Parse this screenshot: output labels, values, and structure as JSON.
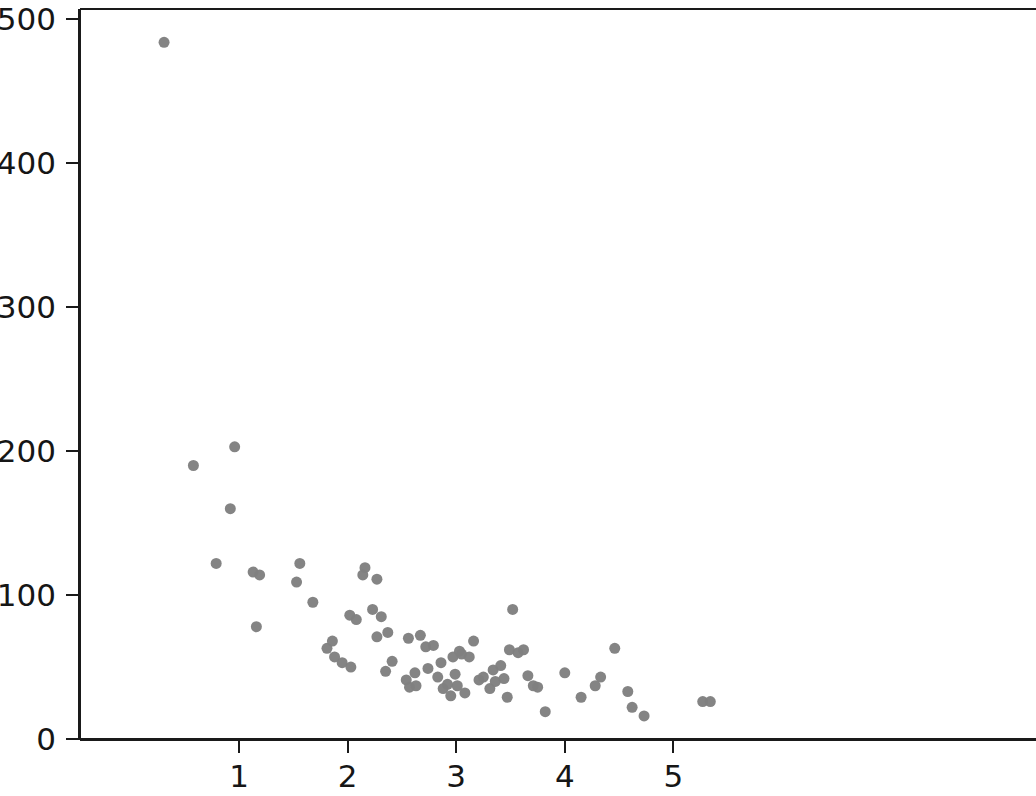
{
  "chart_data": {
    "type": "scatter",
    "title": "",
    "subtitle": "",
    "xlabel": "",
    "ylabel": "",
    "xlim": [
      0.14,
      5.72
    ],
    "ylim": [
      -5.6,
      507
    ],
    "xticks": [
      1,
      2,
      3,
      4,
      5
    ],
    "xtick_labels": [
      "1",
      "2",
      "3",
      "4",
      "5"
    ],
    "yticks": [
      0,
      100,
      200,
      300,
      400,
      500
    ],
    "ytick_labels": [
      "0",
      "100",
      "200",
      "300",
      "400",
      "500"
    ],
    "grid": false,
    "legend": null,
    "marker": {
      "shape": "circle",
      "color": "#808080",
      "size_px": 11,
      "edge": "none"
    },
    "series": [
      {
        "name": "series-1",
        "color": "#808080",
        "points": [
          [
            0.31,
            484
          ],
          [
            0.58,
            190
          ],
          [
            0.96,
            203
          ],
          [
            0.92,
            160
          ],
          [
            0.79,
            122
          ],
          [
            1.13,
            116
          ],
          [
            1.19,
            114
          ],
          [
            1.16,
            78
          ],
          [
            1.56,
            122
          ],
          [
            1.53,
            109
          ],
          [
            1.68,
            95
          ],
          [
            1.81,
            63
          ],
          [
            1.86,
            68
          ],
          [
            1.88,
            57
          ],
          [
            1.95,
            53
          ],
          [
            2.02,
            86
          ],
          [
            2.03,
            50
          ],
          [
            2.08,
            83
          ],
          [
            2.16,
            119
          ],
          [
            2.14,
            114
          ],
          [
            2.27,
            111
          ],
          [
            2.23,
            90
          ],
          [
            2.31,
            85
          ],
          [
            2.27,
            71
          ],
          [
            2.37,
            74
          ],
          [
            2.41,
            54
          ],
          [
            2.35,
            47
          ],
          [
            2.54,
            41
          ],
          [
            2.57,
            36
          ],
          [
            2.62,
            46
          ],
          [
            2.63,
            37
          ],
          [
            2.56,
            70
          ],
          [
            2.67,
            72
          ],
          [
            2.72,
            64
          ],
          [
            2.74,
            49
          ],
          [
            2.79,
            65
          ],
          [
            2.83,
            43
          ],
          [
            2.86,
            53
          ],
          [
            2.88,
            35
          ],
          [
            2.92,
            38
          ],
          [
            2.95,
            30
          ],
          [
            2.97,
            57
          ],
          [
            2.99,
            45
          ],
          [
            3.01,
            37
          ],
          [
            3.03,
            61
          ],
          [
            3.05,
            59
          ],
          [
            3.08,
            32
          ],
          [
            3.12,
            57
          ],
          [
            3.16,
            68
          ],
          [
            3.21,
            41
          ],
          [
            3.25,
            43
          ],
          [
            3.31,
            35
          ],
          [
            3.34,
            48
          ],
          [
            3.36,
            40
          ],
          [
            3.41,
            51
          ],
          [
            3.44,
            42
          ],
          [
            3.47,
            29
          ],
          [
            3.52,
            90
          ],
          [
            3.49,
            62
          ],
          [
            3.57,
            60
          ],
          [
            3.62,
            62
          ],
          [
            3.66,
            44
          ],
          [
            3.71,
            37
          ],
          [
            3.75,
            36
          ],
          [
            3.82,
            19
          ],
          [
            4.0,
            46
          ],
          [
            4.15,
            29
          ],
          [
            4.28,
            37
          ],
          [
            4.33,
            43
          ],
          [
            4.46,
            63
          ],
          [
            4.58,
            33
          ],
          [
            4.62,
            22
          ],
          [
            4.73,
            16
          ],
          [
            5.27,
            26
          ],
          [
            5.34,
            26
          ]
        ]
      }
    ]
  },
  "axes": {
    "frame_color": "#1a1a1a",
    "background_color": "#ffffff",
    "tick_direction": "out"
  }
}
